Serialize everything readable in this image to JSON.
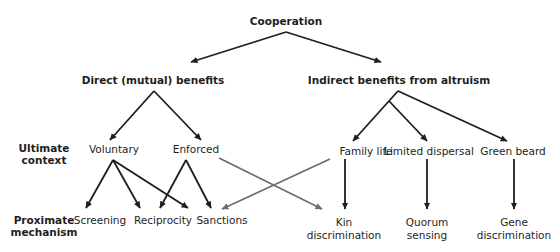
{
  "title": "Cooperation",
  "benefit_types": {
    "direct": "Direct (mutual) benefits",
    "indirect": "Indirect benefits from altruism"
  },
  "row_labels": {
    "ultimate": [
      "Ultimate",
      "context"
    ],
    "proximate": [
      "Proximate",
      "mechanism"
    ]
  },
  "ultimate_contexts": {
    "voluntary": "Voluntary",
    "enforced": "Enforced",
    "family_life": "Family life",
    "limited_dispersal": "Limited dispersal",
    "green_beard": "Green beard"
  },
  "proximate_mechanisms": {
    "screening": "Screening",
    "reciprocity": "Reciprocity",
    "sanctions": "Sanctions",
    "kin_discrimination": [
      "Kin",
      "discrimination"
    ],
    "quorum_sensing": [
      "Quorum",
      "sensing"
    ],
    "gene_discrimination": [
      "Gene",
      "discrimination"
    ]
  },
  "colors": {
    "arrow_primary": "#1e1e1e",
    "arrow_cross": "#6e6e6e"
  },
  "edges": [
    {
      "from": "Cooperation",
      "to": "Direct (mutual) benefits",
      "style": "primary"
    },
    {
      "from": "Cooperation",
      "to": "Indirect benefits from altruism",
      "style": "primary"
    },
    {
      "from": "Direct (mutual) benefits",
      "to": "Voluntary",
      "style": "primary"
    },
    {
      "from": "Direct (mutual) benefits",
      "to": "Enforced",
      "style": "primary"
    },
    {
      "from": "Indirect benefits from altruism",
      "to": "Family life",
      "style": "primary"
    },
    {
      "from": "Indirect benefits from altruism",
      "to": "Limited dispersal",
      "style": "primary"
    },
    {
      "from": "Indirect benefits from altruism",
      "to": "Green beard",
      "style": "primary"
    },
    {
      "from": "Voluntary",
      "to": "Screening",
      "style": "primary"
    },
    {
      "from": "Voluntary",
      "to": "Reciprocity",
      "style": "primary"
    },
    {
      "from": "Voluntary",
      "to": "Sanctions",
      "style": "primary"
    },
    {
      "from": "Enforced",
      "to": "Reciprocity",
      "style": "primary"
    },
    {
      "from": "Enforced",
      "to": "Sanctions",
      "style": "primary"
    },
    {
      "from": "Enforced",
      "to": "Kin discrimination",
      "style": "cross"
    },
    {
      "from": "Family life",
      "to": "Sanctions",
      "style": "cross"
    },
    {
      "from": "Family life",
      "to": "Kin discrimination",
      "style": "primary"
    },
    {
      "from": "Limited dispersal",
      "to": "Quorum sensing",
      "style": "primary"
    },
    {
      "from": "Green beard",
      "to": "Gene discrimination",
      "style": "primary"
    }
  ]
}
